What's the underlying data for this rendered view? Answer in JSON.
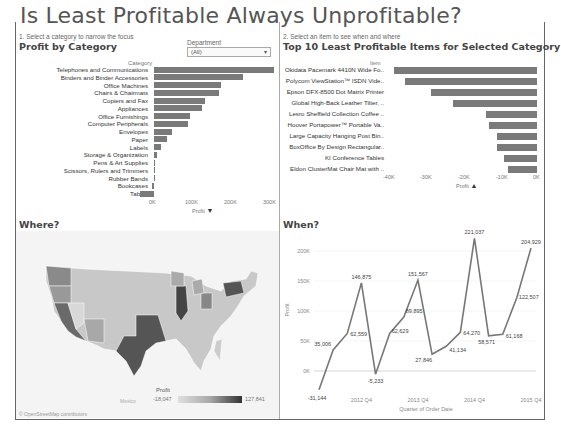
{
  "title": "Is Least Profitable Always Unprofitable?",
  "profit_by_category": {
    "instruction": "1. Select a category to narrow the focus",
    "heading": "Profit by Category",
    "column_header": "Category",
    "axis_label": "Profit",
    "ticks": [
      "0K",
      "100K",
      "200K",
      "300K"
    ],
    "filter": {
      "label": "Department",
      "value": "(All)"
    }
  },
  "top10": {
    "instruction": "2. Select an item to see when and where",
    "heading": "Top 10 Least Profitable Items for Selected Category",
    "column_header": "Item",
    "axis_label": "Profit",
    "ticks": [
      "-40K",
      "-30K",
      "-20K",
      "-10K",
      "0K"
    ]
  },
  "where": {
    "heading": "Where?",
    "map_label": "Mexico",
    "legend_title": "Profit",
    "legend_min": "-18,047",
    "legend_max": "127,841",
    "attribution": "© OpenStreetMap contributors"
  },
  "when": {
    "heading": "When?",
    "axis_label_y": "Profit",
    "axis_label_x": "Quarter of Order Date",
    "y_ticks": [
      "200K",
      "150K",
      "100K",
      "50K",
      "0K"
    ],
    "x_ticks": [
      "2012 Q4",
      "2013 Q4",
      "2014 Q4",
      "2015 Q4"
    ]
  },
  "chart_data": [
    {
      "type": "bar",
      "title": "Profit by Category",
      "xlabel": "Profit",
      "ylabel": "Category",
      "xlim": [
        -40000,
        310000
      ],
      "categories": [
        "Telephones and Communications",
        "Binders and Binder Accessories",
        "Office Machines",
        "Chairs & Chairmats",
        "Copiers and Fax",
        "Appliances",
        "Office Furnishings",
        "Computer Peripherals",
        "Envelopes",
        "Paper",
        "Labels",
        "Storage & Organization",
        "Pens & Art Supplies",
        "Scissors, Rulers and Trimmers",
        "Rubber Bands",
        "Bookcases",
        "Tables"
      ],
      "values": [
        308000,
        228000,
        171000,
        167000,
        131000,
        123000,
        92000,
        88000,
        46000,
        34000,
        17000,
        7000,
        1000,
        -1000,
        -1000,
        -4000,
        -36000
      ]
    },
    {
      "type": "bar",
      "title": "Top 10 Least Profitable Items for Selected Category",
      "xlabel": "Profit",
      "ylabel": "Item",
      "xlim": [
        -40000,
        0
      ],
      "categories": [
        "Okidata Pacemark 4410N Wide Fo..",
        "Polycom ViewStation™ ISDN Vide..",
        "Epson DFX-8500 Dot Matrix Printer",
        "Global High-Back Leather Tilter, ..",
        "Lesro Sheffield Collection Coffee ..",
        "Hoover Portapower™ Portable Va..",
        "Large Capacity Hanging Post Bin..",
        "BoxOffice By Design Rectangular..",
        "KI Conference Tables",
        "Eldon ClusterMat Chair Mat with .."
      ],
      "values": [
        -39000,
        -36000,
        -29000,
        -23000,
        -14000,
        -13000,
        -11000,
        -11000,
        -9000,
        -8000
      ]
    },
    {
      "type": "line",
      "title": "When?",
      "xlabel": "Quarter of Order Date",
      "ylabel": "Profit",
      "ylim": [
        -40000,
        230000
      ],
      "x": [
        "2012 Q1",
        "2012 Q2",
        "2012 Q3",
        "2012 Q4",
        "2013 Q1",
        "2013 Q2",
        "2013 Q3",
        "2013 Q4",
        "2014 Q1",
        "2014 Q2",
        "2014 Q3",
        "2014 Q4",
        "2015 Q1",
        "2015 Q2",
        "2015 Q3",
        "2015 Q4"
      ],
      "values": [
        -31144,
        35006,
        62559,
        146875,
        -5233,
        62629,
        89895,
        151567,
        27846,
        41134,
        64270,
        221037,
        58571,
        61168,
        122507,
        204929
      ],
      "labels": [
        "-31,144",
        "35,006",
        "62,559",
        "146,875",
        "-5,233",
        "62,629",
        "89,895",
        "151,567",
        "27,846",
        "41,134",
        "64,270",
        "221,037",
        "58,571",
        "61,168",
        "122,507",
        "204,929"
      ]
    }
  ]
}
